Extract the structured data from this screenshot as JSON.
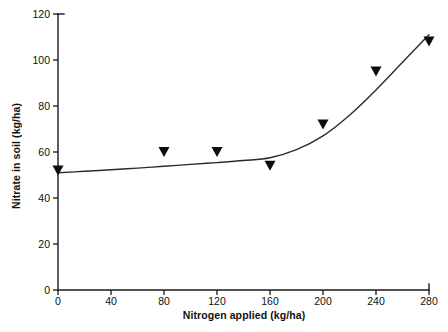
{
  "chart_data": {
    "type": "line",
    "title": "",
    "xlabel": "Nitrogen applied (kg/ha)",
    "ylabel": "Nitrate in soil (kg/ha)",
    "xlim": [
      0,
      280
    ],
    "ylim": [
      0,
      120
    ],
    "xticks": [
      0,
      40,
      80,
      120,
      160,
      200,
      240,
      280
    ],
    "xtick_labels": [
      "0",
      "40",
      "80",
      "120",
      "160",
      "200",
      "240",
      "280"
    ],
    "yticks": [
      0,
      20,
      40,
      60,
      80,
      100,
      120
    ],
    "ytick_labels": [
      "0",
      "20",
      "40",
      "60",
      "80",
      "100",
      "120"
    ],
    "grid": false,
    "legend": null,
    "marker": "triangle-down",
    "marker_color": "#0d0d0d",
    "line_color": "#2b2b2b",
    "series": [
      {
        "name": "Nitrate in soil",
        "x": [
          0,
          80,
          120,
          160,
          200,
          240,
          280
        ],
        "values": [
          52,
          60,
          60,
          54,
          72,
          95,
          108
        ]
      }
    ],
    "fit_curve": {
      "name": "fitted trend",
      "x": [
        0,
        20,
        40,
        60,
        80,
        100,
        120,
        140,
        160,
        180,
        200,
        220,
        240,
        260,
        280
      ],
      "values": [
        51,
        51.6,
        52.3,
        53,
        53.8,
        54.6,
        55.4,
        56.3,
        57.5,
        61,
        67,
        76,
        87,
        99,
        111
      ]
    }
  },
  "axis_labels": {
    "x": "Nitrogen applied (kg/ha)",
    "y": "Nitrate in soil (kg/ha)"
  }
}
